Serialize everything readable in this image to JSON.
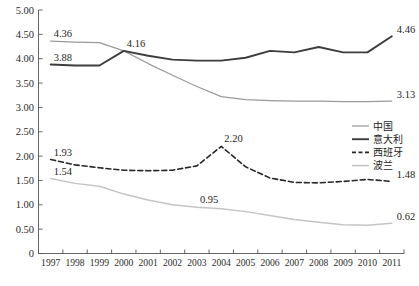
{
  "chart_data": {
    "type": "line",
    "title": "",
    "xlabel": "",
    "ylabel": "",
    "ylim": [
      0,
      5.0
    ],
    "grid": false,
    "legend_position": "right-middle",
    "categories": [
      "1997",
      "1998",
      "1999",
      "2000",
      "2001",
      "2002",
      "2003",
      "2004",
      "2005",
      "2006",
      "2007",
      "2008",
      "2009",
      "2010",
      "2011"
    ],
    "y_ticks": [
      "0",
      "0.50",
      "1.00",
      "1.50",
      "2.00",
      "2.50",
      "3.00",
      "3.50",
      "4.00",
      "4.50",
      "5.00"
    ],
    "series": [
      {
        "name": "中国",
        "style": "solid-light",
        "color": "#9a9a9a",
        "values": [
          4.36,
          4.34,
          4.33,
          4.16,
          3.9,
          3.66,
          3.43,
          3.22,
          3.16,
          3.14,
          3.13,
          3.13,
          3.12,
          3.12,
          3.13
        ],
        "labels": [
          {
            "index": 0,
            "text": "4.36"
          },
          {
            "index": 14,
            "text": "3.13"
          }
        ]
      },
      {
        "name": "意大利",
        "style": "solid-dark",
        "color": "#3d3d3d",
        "values": [
          3.88,
          3.86,
          3.86,
          4.16,
          4.06,
          3.98,
          3.96,
          3.96,
          4.02,
          4.16,
          4.13,
          4.24,
          4.13,
          4.13,
          4.46
        ],
        "labels": [
          {
            "index": 0,
            "text": "3.88"
          },
          {
            "index": 3,
            "text": "4.16"
          },
          {
            "index": 14,
            "text": "4.46"
          }
        ]
      },
      {
        "name": "西班牙",
        "style": "dashed",
        "color": "#262626",
        "values": [
          1.93,
          1.82,
          1.76,
          1.71,
          1.7,
          1.71,
          1.8,
          2.2,
          1.78,
          1.55,
          1.46,
          1.45,
          1.48,
          1.52,
          1.48
        ],
        "labels": [
          {
            "index": 0,
            "text": "1.93"
          },
          {
            "index": 7,
            "text": "2.20"
          },
          {
            "index": 14,
            "text": "1.48"
          }
        ]
      },
      {
        "name": "波兰",
        "style": "solid-lighter",
        "color": "#c4c4c4",
        "values": [
          1.54,
          1.44,
          1.38,
          1.22,
          1.1,
          1.0,
          0.95,
          0.92,
          0.86,
          0.78,
          0.7,
          0.64,
          0.59,
          0.58,
          0.62
        ],
        "labels": [
          {
            "index": 0,
            "text": "1.54"
          },
          {
            "index": 6,
            "text": "0.95"
          },
          {
            "index": 14,
            "text": "0.62"
          }
        ]
      }
    ],
    "legend_entries": [
      {
        "label": "中国",
        "style": "solid-light",
        "color": "#9a9a9a"
      },
      {
        "label": "意大利",
        "style": "solid-dark",
        "color": "#3d3d3d"
      },
      {
        "label": "西班牙",
        "style": "dashed",
        "color": "#262626"
      },
      {
        "label": "波兰",
        "style": "solid-lighter",
        "color": "#c4c4c4"
      }
    ]
  },
  "axis": {
    "y_labels": [
      "5.00",
      "4.50",
      "4.00",
      "3.50",
      "3.00",
      "2.50",
      "2.00",
      "1.50",
      "1.00",
      "0.50",
      "0"
    ],
    "x_labels": [
      "1997",
      "1998",
      "1999",
      "2000",
      "2001",
      "2002",
      "2003",
      "2004",
      "2005",
      "2006",
      "2007",
      "2008",
      "2009",
      "2010",
      "2011"
    ]
  }
}
